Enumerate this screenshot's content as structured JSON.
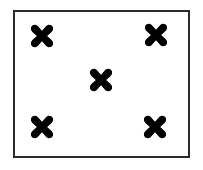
{
  "figure": {
    "background_color": "#ffffff",
    "frame": {
      "name": "rectangular-border",
      "border_color": "#2b2b2b",
      "border_width_px": 2,
      "fill_color": "#ffffff",
      "x": 13,
      "y": 10,
      "width": 177,
      "height": 148
    },
    "marks": {
      "glyph": "heavy-multiplication-x",
      "glyph_char": "✖",
      "color": "#000000",
      "count": 5,
      "size_px": 21,
      "pattern": "quincunx",
      "items": [
        {
          "name": "mark-top-left",
          "label": "top-left",
          "cx": 42,
          "cy": 36
        },
        {
          "name": "mark-top-right",
          "label": "top-right",
          "cx": 156,
          "cy": 35
        },
        {
          "name": "mark-center",
          "label": "center",
          "cx": 101,
          "cy": 80
        },
        {
          "name": "mark-bottom-left",
          "label": "bottom-left",
          "cx": 42,
          "cy": 127
        },
        {
          "name": "mark-bottom-right",
          "label": "bottom-right",
          "cx": 155,
          "cy": 127
        }
      ]
    }
  }
}
